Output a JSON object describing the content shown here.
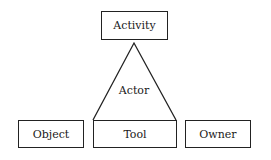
{
  "diagram": {
    "nodes": {
      "activity": "Activity",
      "actor": "Actor",
      "object": "Object",
      "tool": "Tool",
      "owner": "Owner"
    },
    "relations": [
      {
        "from": "actor",
        "to": "activity",
        "shape": "triangle-apex"
      },
      {
        "from": "actor",
        "to": "tool",
        "shape": "triangle-base"
      }
    ]
  }
}
